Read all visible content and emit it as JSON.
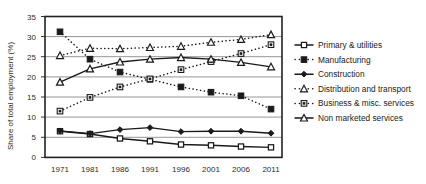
{
  "chart_data": {
    "type": "line",
    "title": "",
    "xlabel": "",
    "ylabel": "Share of total employment (%)",
    "categories": [
      "1971",
      "1981",
      "1986",
      "1991",
      "1996",
      "2001",
      "2006",
      "2011"
    ],
    "ylim": [
      0,
      35
    ],
    "yticks": [
      "0",
      "5",
      "10",
      "15",
      "20",
      "25",
      "30",
      "35"
    ],
    "grid": "horizontal",
    "legend_position": "right",
    "series": [
      {
        "name": "Primary & utilities",
        "marker": "open-square",
        "line": "solid",
        "values": [
          6.5,
          5.8,
          4.7,
          4.0,
          3.2,
          3.0,
          2.7,
          2.5
        ]
      },
      {
        "name": "Manufacturing",
        "marker": "filled-square",
        "line": "dotted",
        "values": [
          31.2,
          24.4,
          21.2,
          19.4,
          17.5,
          16.2,
          15.3,
          12.0
        ]
      },
      {
        "name": "Construction",
        "marker": "small-diamond",
        "line": "solid",
        "values": [
          6.6,
          5.9,
          6.9,
          7.4,
          6.4,
          6.5,
          6.5,
          6.0
        ]
      },
      {
        "name": "Distribution and transport",
        "marker": "open-triangle",
        "line": "dotted",
        "values": [
          25.3,
          27.1,
          27.0,
          27.3,
          27.6,
          28.6,
          29.3,
          30.5
        ]
      },
      {
        "name": "Business & misc. services",
        "marker": "boxed-square",
        "line": "dotted",
        "values": [
          11.5,
          14.9,
          17.5,
          19.5,
          21.8,
          23.8,
          25.8,
          28.0
        ]
      },
      {
        "name": "Non marketed services",
        "marker": "open-triangle",
        "line": "solid",
        "values": [
          18.7,
          22.0,
          23.7,
          24.4,
          24.8,
          24.4,
          23.6,
          22.5
        ]
      }
    ]
  },
  "colors": {
    "ink": "#1a1a1a",
    "grid": "#808080",
    "axis": "#333333",
    "plot_background": "#ffffff"
  },
  "legend": {
    "items": [
      {
        "label": "Primary & utilities"
      },
      {
        "label": "Manufacturing"
      },
      {
        "label": "Construction"
      },
      {
        "label": "Distribution and transport"
      },
      {
        "label": "Business & misc. services"
      },
      {
        "label": "Non marketed services"
      }
    ]
  },
  "yaxis": {
    "title": "Share of total employment (%)",
    "ticks": [
      "35",
      "30",
      "25",
      "20",
      "15",
      "10",
      "5",
      "0"
    ]
  },
  "xaxis": {
    "ticks": [
      "1971",
      "1981",
      "1986",
      "1991",
      "1996",
      "2001",
      "2006",
      "2011"
    ]
  }
}
